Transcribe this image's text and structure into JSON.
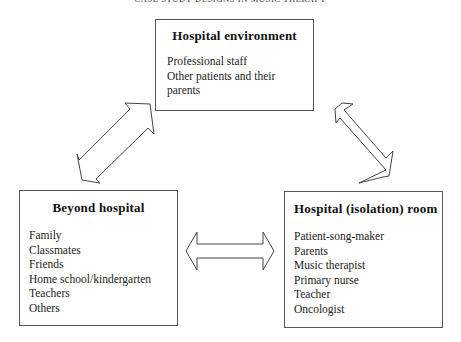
{
  "running_head": "CASE STUDY DESIGNS IN MUSIC THERAPY",
  "diagram": {
    "nodes": [
      {
        "id": "hospital-environment",
        "title": "Hospital environment",
        "items": [
          "Professional staff",
          "Other patients and their parents"
        ]
      },
      {
        "id": "beyond-hospital",
        "title": "Beyond hospital",
        "items": [
          "Family",
          "Classmates",
          "Friends",
          "Home school/kindergarten",
          "Teachers",
          "Others"
        ]
      },
      {
        "id": "hospital-isolation-room",
        "title": "Hospital (isolation) room",
        "items": [
          "Patient-song-maker",
          "Parents",
          "Music therapist",
          "Primary nurse",
          "Teacher",
          "Oncologist"
        ]
      }
    ],
    "edges": [
      {
        "from": "beyond-hospital",
        "to": "hospital-environment",
        "type": "double-arrow"
      },
      {
        "from": "hospital-environment",
        "to": "hospital-isolation-room",
        "type": "double-arrow"
      },
      {
        "from": "beyond-hospital",
        "to": "hospital-isolation-room",
        "type": "double-arrow"
      }
    ]
  },
  "colors": {
    "border": "#555555",
    "arrow_stroke": "#444444",
    "background": "#ffffff"
  }
}
